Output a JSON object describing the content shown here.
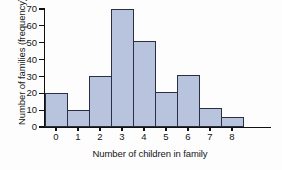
{
  "chart_data": {
    "type": "bar",
    "title": "",
    "subtitle": "",
    "xlabel": "Number of children in family",
    "ylabel": "Number of families (frequency)",
    "categories": [
      "0",
      "1",
      "2",
      "3",
      "4",
      "5",
      "6",
      "7",
      "8"
    ],
    "values": [
      20,
      10,
      30,
      70,
      51,
      21,
      31,
      11,
      6
    ],
    "series": [
      {
        "name": "Number of families",
        "values": [
          20,
          10,
          30,
          70,
          51,
          21,
          31,
          11,
          6
        ]
      }
    ],
    "ylim": [
      0,
      70
    ],
    "xlim": [
      0,
      9
    ],
    "y_ticks": [
      0,
      10,
      20,
      30,
      40,
      50,
      60,
      70
    ],
    "y_tick_labels": [
      "0",
      "10",
      "20",
      "30",
      "40",
      "50",
      "60",
      "70"
    ],
    "x_ticks": [
      0,
      1,
      2,
      3,
      4,
      5,
      6,
      7,
      8
    ],
    "x_tick_labels": [
      "0",
      "1",
      "2",
      "3",
      "4",
      "5",
      "6",
      "7",
      "8"
    ],
    "grid": false,
    "legend": null,
    "legend_position": "none",
    "annotations": [],
    "colors": {
      "bar_fill": "#b8c4de",
      "bar_edge": "#2b2f44",
      "axis": "#111111",
      "text": "#161616",
      "background": "#fdfdfd"
    }
  }
}
